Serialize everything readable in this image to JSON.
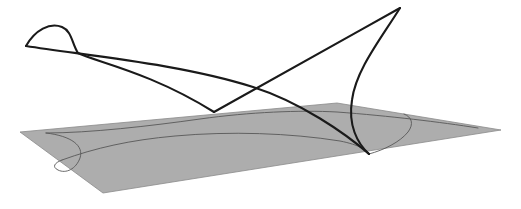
{
  "figure": {
    "title": "",
    "caption": "",
    "type": "3d-space-curve-with-projection-plane",
    "background_color": "#ffffff",
    "canvas": {
      "width": 521,
      "height": 209
    }
  },
  "plane": {
    "name": "projection-plane",
    "fill_color": "#adadad",
    "edge_color": "#8a8a8a",
    "edge_width": 0.8,
    "corners": [
      {
        "label": "left",
        "x": 20,
        "y": 132
      },
      {
        "label": "top",
        "x": 337,
        "y": 103
      },
      {
        "label": "right",
        "x": 501,
        "y": 130
      },
      {
        "label": "bottom",
        "x": 103,
        "y": 193
      }
    ]
  },
  "space_curve": {
    "name": "space-curve",
    "stroke_color": "#1a1a1a",
    "stroke_width": 2.1,
    "key_points": [
      {
        "label": "loop-left-tip",
        "x": 26,
        "y": 46
      },
      {
        "label": "loop-apex",
        "x": 62,
        "y": 27
      },
      {
        "label": "loop-crossing",
        "x": 78,
        "y": 53
      },
      {
        "label": "lower-cusp-on-plane",
        "x": 214,
        "y": 112
      },
      {
        "label": "branch-crossing",
        "x": 253,
        "y": 87
      },
      {
        "label": "upper-apex",
        "x": 400,
        "y": 8
      },
      {
        "label": "right-cusp-on-plane",
        "x": 369,
        "y": 154
      }
    ],
    "branches": [
      {
        "name": "upper-sweep-branch",
        "d": "M 26 46 C 35 30, 50 22, 62 27 C 72 31, 72 44, 78 53 C 96 62, 150 72, 214 112"
      },
      {
        "name": "long-chord-branch",
        "d": "M 26 46 C 90 56, 180 64, 253 87 C 300 102, 345 133, 369 154"
      },
      {
        "name": "rising-branch-to-apex",
        "d": "M 214 112 C 250 92, 330 47, 400 8"
      },
      {
        "name": "descending-curved-branch",
        "d": "M 400 8 C 380 40, 356 70, 352 100 C 348 125, 357 143, 369 154"
      }
    ]
  },
  "projected_curve": {
    "name": "projected-shadow-curve",
    "stroke_color": "#585858",
    "stroke_width": 0.9,
    "branches": [
      {
        "name": "shadow-upper-arc",
        "d": "M 46 133 C 90 133, 150 126, 200 119 C 250 112, 300 110, 337 112 C 390 116, 440 122, 478 128"
      },
      {
        "name": "shadow-lower-arc",
        "d": "M 62 160 C 95 148, 130 140, 175 136 C 230 131, 290 133, 340 141 C 360 145, 366 150, 369 154"
      },
      {
        "name": "shadow-left-loop",
        "d": "M 46 133 C 72 136, 84 146, 80 158 C 76 169, 66 174, 58 170 C 52 167, 54 163, 62 160"
      },
      {
        "name": "shadow-right-cap",
        "d": "M 369 154 C 384 150, 400 142, 408 132 C 414 124, 412 117, 404 114"
      }
    ]
  },
  "annotations": []
}
